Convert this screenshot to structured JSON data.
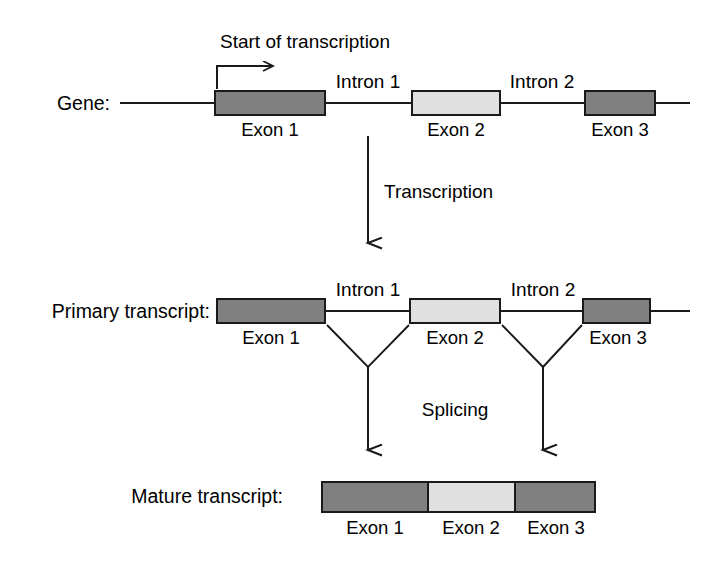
{
  "figure": {
    "title_text_top": "Start of transcription",
    "background_color": "#ffffff",
    "stroke_color": "#1a1a1a",
    "exon_dark_color": "#808080",
    "exon_light_color": "#e0e0e0"
  },
  "rows": {
    "gene": {
      "label": "Gene:",
      "exons": [
        {
          "name": "Exon 1",
          "shade": "dark"
        },
        {
          "name": "Exon 2",
          "shade": "light"
        },
        {
          "name": "Exon 3",
          "shade": "dark"
        }
      ],
      "introns": [
        {
          "name": "Intron 1"
        },
        {
          "name": "Intron 2"
        }
      ]
    },
    "primary_transcript": {
      "label": "Primary transcript:",
      "exons": [
        {
          "name": "Exon 1",
          "shade": "dark"
        },
        {
          "name": "Exon 2",
          "shade": "light"
        },
        {
          "name": "Exon 3",
          "shade": "dark"
        }
      ],
      "introns": [
        {
          "name": "Intron 1"
        },
        {
          "name": "Intron 2"
        }
      ]
    },
    "mature_transcript": {
      "label": "Mature transcript:",
      "exons": [
        {
          "name": "Exon 1",
          "shade": "dark"
        },
        {
          "name": "Exon 2",
          "shade": "light"
        },
        {
          "name": "Exon 3",
          "shade": "dark"
        }
      ]
    }
  },
  "processes": {
    "transcription": "Transcription",
    "splicing": "Splicing"
  },
  "annotations": {
    "start_of_transcription": "Start of transcription",
    "start_arrow_icon": "bent-right-arrow-icon",
    "transcription_arrow_icon": "down-arrow-icon",
    "splice_arrow_icon": "down-arrow-icon"
  }
}
